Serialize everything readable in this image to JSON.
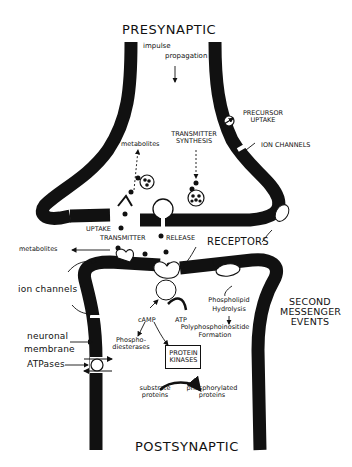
{
  "diagram": {
    "type": "synapse-schematic",
    "regions": {
      "top": "PRESYNAPTIC",
      "bottom": "POSTSYNAPTIC"
    },
    "labels": {
      "impulse": "impulse",
      "propagation": "propagation",
      "precursor_uptake_1": "PRECURSOR",
      "precursor_uptake_2": "UPTAKE",
      "transmitter_synthesis_1": "TRANSMITTER",
      "transmitter_synthesis_2": "SYNTHESIS",
      "ion_channels_pre": "ION CHANNELS",
      "metabolites_pre": "metabolites",
      "uptake": "UPTAKE",
      "transmitter": "TRANSMITTER",
      "release": "RELEASE",
      "receptors": "RECEPTORS",
      "metabolites_cleft": "metabolites",
      "ion_channels_post": "ion channels",
      "neuronal_membrane_1": "neuronal",
      "neuronal_membrane_2": "membrane",
      "atpases": "ATPases",
      "camp": "cAMP",
      "atp": "ATP",
      "phosphodiesterases_1": "Phospho-",
      "phosphodiesterases_2": "diesterases",
      "protein_kinases_1": "PROTEIN",
      "protein_kinases_2": "KINASES",
      "substrate_proteins_1": "substrate",
      "substrate_proteins_2": "proteins",
      "phosphorylated_proteins_1": "phosphorylated",
      "phosphorylated_proteins_2": "proteins",
      "phospholipid": "Phospholipid",
      "hydrolysis": "Hydrolysis",
      "polyphosphoinositide": "Polyphosphoinositide",
      "formation": "Formation",
      "second_messenger_1": "SECOND",
      "second_messenger_2": "MESSENGER",
      "second_messenger_3": "EVENTS"
    },
    "colors": {
      "ink": "#111111",
      "background": "#ffffff"
    }
  }
}
